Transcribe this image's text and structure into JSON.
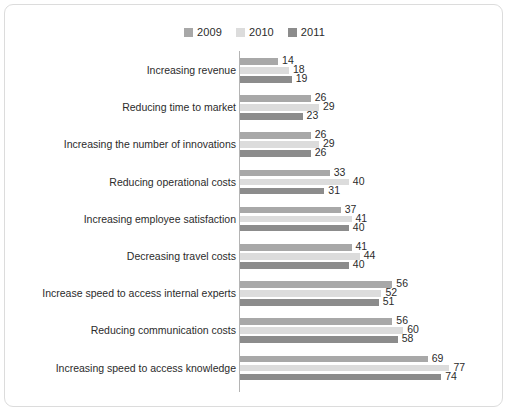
{
  "chart_data": {
    "type": "bar",
    "orientation": "horizontal",
    "title": "",
    "xlabel": "",
    "ylabel": "",
    "grid": false,
    "legend_position": "top-center",
    "xlim": [
      0,
      80
    ],
    "categories": [
      "Increasing revenue",
      "Reducing time to market",
      "Increasing the number of innovations",
      "Reducing operational costs",
      "Increasing employee satisfaction",
      "Decreasing travel costs",
      "Increase speed to access internal experts",
      "Reducing communication costs",
      "Increasing speed to access knowledge"
    ],
    "series": [
      {
        "name": "2009",
        "color": "#a8a8a8",
        "values": [
          14,
          26,
          26,
          33,
          37,
          41,
          56,
          56,
          69
        ]
      },
      {
        "name": "2010",
        "color": "#dcdcdc",
        "values": [
          18,
          29,
          29,
          40,
          41,
          44,
          52,
          60,
          77
        ]
      },
      {
        "name": "2011",
        "color": "#8c8c8c",
        "values": [
          19,
          23,
          26,
          31,
          40,
          40,
          51,
          58,
          74
        ]
      }
    ]
  },
  "legend": {
    "items": [
      {
        "label": "2009",
        "color": "#a8a8a8"
      },
      {
        "label": "2010",
        "color": "#dcdcdc"
      },
      {
        "label": "2011",
        "color": "#8c8c8c"
      }
    ]
  },
  "style": {
    "border_color": "#dcdcdc",
    "axis_color": "#b4b4b4",
    "text_color": "#2b2b2b",
    "background": "#ffffff"
  }
}
